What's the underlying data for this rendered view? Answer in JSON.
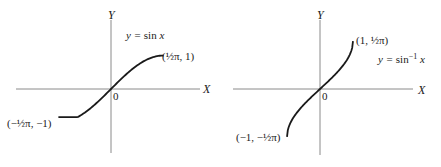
{
  "figure": {
    "panels": [
      {
        "id": "sine",
        "x_axis_label": "X",
        "y_axis_label": "Y",
        "origin_label": "0",
        "equation": {
          "prefix": "y = ",
          "func": "sin",
          "suffix": " x"
        },
        "endpoint_upper": "(½π, 1)",
        "endpoint_lower": "(−½π, −1)",
        "function": "sin",
        "domain": [
          -1.5708,
          1.5708
        ],
        "range": [
          -1,
          1
        ]
      },
      {
        "id": "arcsine",
        "x_axis_label": "X",
        "y_axis_label": "Y",
        "origin_label": "0",
        "equation": {
          "prefix": "y = ",
          "func": "sin",
          "sup": "−1",
          "suffix": " x"
        },
        "endpoint_upper": "(1, ½π)",
        "endpoint_lower": "(−1, −½π)",
        "function": "arcsin",
        "domain": [
          -1,
          1
        ],
        "range": [
          -1.5708,
          1.5708
        ]
      }
    ]
  }
}
